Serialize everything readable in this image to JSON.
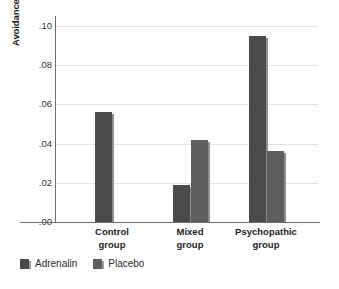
{
  "chart_data": {
    "type": "bar",
    "title": "",
    "xlabel": "",
    "ylabel": "Avoidance learning score",
    "ylim": [
      0.0,
      0.105
    ],
    "grid": true,
    "legend_position": "bottom-left",
    "categories": [
      "Control group",
      "Mixed group",
      "Psychopathic group"
    ],
    "category_lines": [
      [
        "Control",
        "group"
      ],
      [
        "Mixed",
        "group"
      ],
      [
        "Psychopathic",
        "group"
      ]
    ],
    "ytick_labels": [
      ".00",
      ".02",
      ".04",
      ".06",
      ".08",
      ".10"
    ],
    "ytick_values": [
      0.0,
      0.02,
      0.04,
      0.06,
      0.08,
      0.1
    ],
    "series": [
      {
        "name": "Adrenalin",
        "color": "#4b4b4b",
        "values": [
          0.056,
          0.019,
          0.095
        ]
      },
      {
        "name": "Placebo",
        "color": "#5e5e5e",
        "values": [
          0.0,
          0.042,
          0.036
        ]
      }
    ]
  },
  "legend": {
    "items": [
      {
        "label": "Adrenalin",
        "color": "#4b4b4b"
      },
      {
        "label": "Placebo",
        "color": "#5e5e5e"
      }
    ]
  },
  "colors": {
    "adrenalin": "#4b4b4b",
    "placebo": "#5e5e5e",
    "gridline": "#e3e3e3",
    "axis": "#6d6d6d",
    "background": "#ffffff"
  }
}
